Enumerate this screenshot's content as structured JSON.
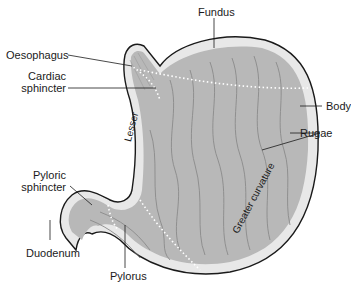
{
  "diagram": {
    "labels": {
      "fundus": "Fundus",
      "oesophagus": "Oesophagus",
      "cardiac_sphincter_1": "Cardiac",
      "cardiac_sphincter_2": "sphincter",
      "body": "Body",
      "rugae": "Rugae",
      "pyloric_sphincter_1": "Pyloric",
      "pyloric_sphincter_2": "sphincter",
      "lesser": "Lesser",
      "greater_curvature": "Greater curvature",
      "duodenum": "Duodenum",
      "pylorus": "Pylorus"
    },
    "colors": {
      "outline": "#1a1a1a",
      "wall": "#e8e8e8",
      "mucosa": "#b8b8b8",
      "rugae_lines": "#8a8a8a",
      "dotted": "#ffffff"
    }
  }
}
